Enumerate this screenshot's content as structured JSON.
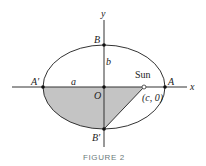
{
  "figure": {
    "caption": "FIGURE 2",
    "axes": {
      "x_label": "x",
      "y_label": "y"
    },
    "points": {
      "A": "A",
      "A_prime": "A′",
      "B": "B",
      "B_prime": "B′",
      "O": "O",
      "focus_coords": "(c, 0)"
    },
    "segment_labels": {
      "a": "a",
      "b": "b"
    },
    "sun_label": "Sun",
    "colors": {
      "stroke": "#333333",
      "shade": "#c4c4c4",
      "caption": "#6b7a7a"
    }
  }
}
